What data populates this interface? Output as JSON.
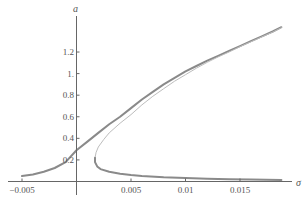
{
  "chart_data": {
    "type": "line",
    "title": "",
    "xlabel": "σ",
    "ylabel": "a",
    "xlim": [
      -0.0055,
      0.0195
    ],
    "ylim": [
      0,
      1.45
    ],
    "grid": false,
    "legend": null,
    "x_ticks": [
      {
        "value": -0.005,
        "label": "-0.005"
      },
      {
        "value": 0.005,
        "label": "0.005"
      },
      {
        "value": 0.01,
        "label": "0.01"
      },
      {
        "value": 0.015,
        "label": "0.015"
      }
    ],
    "y_ticks": [
      {
        "value": 0.2,
        "label": "0.2"
      },
      {
        "value": 0.4,
        "label": "0.4"
      },
      {
        "value": 0.6,
        "label": "0.6"
      },
      {
        "value": 0.8,
        "label": "0.8"
      },
      {
        "value": 1.0,
        "label": "1."
      },
      {
        "value": 1.2,
        "label": "1.2"
      }
    ],
    "series": [
      {
        "name": "upper stable branch",
        "color": "#8a8a8a",
        "width": 2,
        "points": [
          [
            -0.005,
            0.05
          ],
          [
            -0.004,
            0.065
          ],
          [
            -0.003,
            0.09
          ],
          [
            -0.002,
            0.125
          ],
          [
            -0.001,
            0.18
          ],
          [
            0.0,
            0.29
          ],
          [
            0.001,
            0.37
          ],
          [
            0.002,
            0.45
          ],
          [
            0.003,
            0.53
          ],
          [
            0.004,
            0.6
          ],
          [
            0.005,
            0.68
          ],
          [
            0.006,
            0.76
          ],
          [
            0.007,
            0.83
          ],
          [
            0.008,
            0.9
          ],
          [
            0.009,
            0.96
          ],
          [
            0.01,
            1.02
          ],
          [
            0.011,
            1.07
          ],
          [
            0.012,
            1.12
          ],
          [
            0.013,
            1.165
          ],
          [
            0.014,
            1.21
          ],
          [
            0.015,
            1.255
          ],
          [
            0.016,
            1.3
          ],
          [
            0.017,
            1.345
          ],
          [
            0.018,
            1.39
          ],
          [
            0.0188,
            1.43
          ]
        ]
      },
      {
        "name": "middle unstable branch",
        "color": "#bdbdbd",
        "width": 1,
        "points": [
          [
            0.0017,
            0.22
          ],
          [
            0.0018,
            0.27
          ],
          [
            0.002,
            0.32
          ],
          [
            0.0025,
            0.39
          ],
          [
            0.003,
            0.45
          ],
          [
            0.004,
            0.54
          ],
          [
            0.005,
            0.62
          ],
          [
            0.006,
            0.71
          ],
          [
            0.007,
            0.79
          ],
          [
            0.008,
            0.86
          ],
          [
            0.009,
            0.93
          ],
          [
            0.01,
            0.99
          ],
          [
            0.011,
            1.05
          ],
          [
            0.012,
            1.105
          ],
          [
            0.013,
            1.155
          ],
          [
            0.014,
            1.2
          ],
          [
            0.015,
            1.25
          ],
          [
            0.016,
            1.295
          ],
          [
            0.017,
            1.34
          ],
          [
            0.018,
            1.385
          ],
          [
            0.0188,
            1.425
          ]
        ]
      },
      {
        "name": "lower stable branch",
        "color": "#8a8a8a",
        "width": 2,
        "points": [
          [
            0.0017,
            0.22
          ],
          [
            0.0017,
            0.18
          ],
          [
            0.0019,
            0.14
          ],
          [
            0.0022,
            0.115
          ],
          [
            0.003,
            0.09
          ],
          [
            0.004,
            0.072
          ],
          [
            0.005,
            0.06
          ],
          [
            0.006,
            0.052
          ],
          [
            0.008,
            0.04
          ],
          [
            0.01,
            0.032
          ],
          [
            0.012,
            0.026
          ],
          [
            0.014,
            0.021
          ],
          [
            0.016,
            0.018
          ],
          [
            0.0188,
            0.015
          ]
        ]
      }
    ]
  }
}
